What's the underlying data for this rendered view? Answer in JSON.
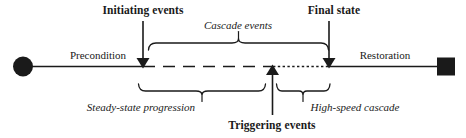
{
  "figure": {
    "type": "process-timeline-diagram",
    "background_color": "#ffffff",
    "ink_color": "#1a1a1a"
  },
  "labels": {
    "initiating_events": "Initiating events",
    "final_state": "Final state",
    "cascade_events": "Cascade events",
    "precondition": "Precondition",
    "restoration": "Restoration",
    "steady_state_progression": "Steady-state progression",
    "high_speed_cascade": "High-speed cascade",
    "triggering_events": "Triggering events"
  },
  "nodes": {
    "start_marker": "filled-circle",
    "end_marker": "filled-square"
  },
  "arrows": {
    "initiating_events_arrow": "down-arrow",
    "final_state_arrow": "down-arrow",
    "triggering_events_arrow": "up-arrow"
  },
  "brackets": {
    "cascade_events_bracket": "top-curly-brace",
    "steady_state_bracket": "bottom-curly-brace",
    "high_speed_bracket": "bottom-curly-brace"
  },
  "timeline": {
    "solid_left_segment": "solid",
    "dashed_middle_segment": "dashed",
    "dotted_right_segment": "dotted",
    "solid_right_segment": "solid"
  }
}
